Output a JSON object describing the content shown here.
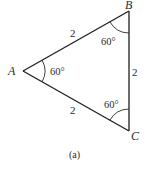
{
  "figure": {
    "caption": "(a)",
    "shape": "equilateral triangle",
    "vertices": {
      "A": {
        "label": "A",
        "angle": "60°"
      },
      "B": {
        "label": "B",
        "angle": "60°"
      },
      "C": {
        "label": "C",
        "angle": "60°"
      }
    },
    "sides": {
      "AB": {
        "label": "2"
      },
      "BC": {
        "label": "2"
      },
      "AC": {
        "label": "2"
      }
    },
    "colors": {
      "stroke": "#1e1e1e",
      "text": "#2a2a2a",
      "background": "#ffffff"
    }
  }
}
